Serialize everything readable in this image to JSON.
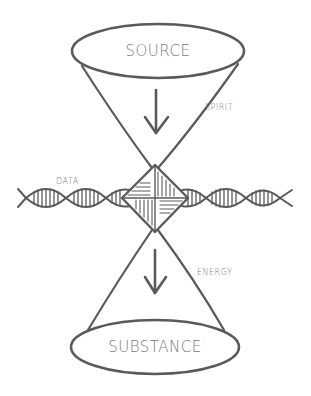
{
  "diagram": {
    "title": "",
    "style": "hand-drawn pencil sketch",
    "colors": {
      "stroke": "#5a5a5a",
      "text": "#7a7a7a",
      "background": "#ffffff"
    },
    "nodes": {
      "top": {
        "label": "SOURCE",
        "shape": "ellipse"
      },
      "bottom": {
        "label": "SUBSTANCE",
        "shape": "ellipse"
      },
      "center": {
        "label": "",
        "shape": "diamond (pinwheel-hatched)"
      }
    },
    "flows": {
      "upper": {
        "label": "SPIRIT",
        "direction": "down"
      },
      "lower": {
        "label": "ENERGY",
        "direction": "down"
      }
    },
    "strand": {
      "label": "DATA",
      "shape": "double helix (DNA)",
      "orientation": "horizontal"
    }
  }
}
